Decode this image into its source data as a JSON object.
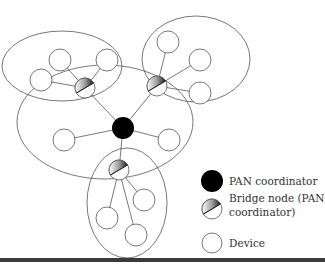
{
  "diagram": {
    "colors": {
      "stroke": "#555555",
      "coordinator": "#000000",
      "device_fill": "#ffffff",
      "rule": "#3a3a3a"
    },
    "clusters": [
      {
        "id": "center",
        "cx": 105,
        "cy": 122,
        "rx": 88,
        "ry": 57
      },
      {
        "id": "top-left",
        "cx": 62,
        "cy": 66,
        "rx": 60,
        "ry": 35
      },
      {
        "id": "top-right",
        "cx": 196,
        "cy": 59,
        "rx": 54,
        "ry": 43
      },
      {
        "id": "bottom",
        "cx": 127,
        "cy": 203,
        "rx": 40,
        "ry": 55
      }
    ],
    "pan_coordinator": {
      "x": 123,
      "y": 128,
      "r": 11
    },
    "bridge_nodes": [
      {
        "id": "bridge-top-left",
        "x": 85,
        "y": 88,
        "r": 10
      },
      {
        "id": "bridge-top-right",
        "x": 157,
        "y": 86,
        "r": 10
      },
      {
        "id": "bridge-bottom",
        "x": 119,
        "y": 170,
        "r": 10
      }
    ],
    "devices": [
      {
        "id": "tl-1",
        "x": 60,
        "y": 60,
        "r": 11,
        "link": "bridge-top-left"
      },
      {
        "id": "tl-2",
        "x": 41,
        "y": 80,
        "r": 11,
        "link": "bridge-top-left"
      },
      {
        "id": "tl-3",
        "x": 107,
        "y": 60,
        "r": 11,
        "link": "bridge-top-left"
      },
      {
        "id": "tr-1",
        "x": 168,
        "y": 42,
        "r": 11,
        "link": "bridge-top-right"
      },
      {
        "id": "tr-2",
        "x": 200,
        "y": 60,
        "r": 11,
        "link": "bridge-top-right"
      },
      {
        "id": "tr-3",
        "x": 200,
        "y": 93,
        "r": 11,
        "link": "bridge-top-right"
      },
      {
        "id": "c-1",
        "x": 64,
        "y": 140,
        "r": 11,
        "link": "pan"
      },
      {
        "id": "c-2",
        "x": 169,
        "y": 140,
        "r": 11,
        "link": "pan"
      },
      {
        "id": "b-1",
        "x": 107,
        "y": 218,
        "r": 11,
        "link": "bridge-bottom"
      },
      {
        "id": "b-2",
        "x": 144,
        "y": 200,
        "r": 11,
        "link": "bridge-bottom"
      },
      {
        "id": "b-3",
        "x": 136,
        "y": 235,
        "r": 11,
        "link": "bridge-bottom"
      }
    ],
    "legend": {
      "items": [
        {
          "type": "pan-coordinator",
          "label": "PAN coordinator",
          "lines": [
            "PAN coordinator"
          ]
        },
        {
          "type": "bridge-node",
          "label": "Bridge node (PAN coordinator)",
          "lines": [
            "Bridge node (PAN",
            "coordinator)"
          ]
        },
        {
          "type": "device",
          "label": "Device",
          "lines": [
            "Device"
          ]
        }
      ]
    }
  }
}
